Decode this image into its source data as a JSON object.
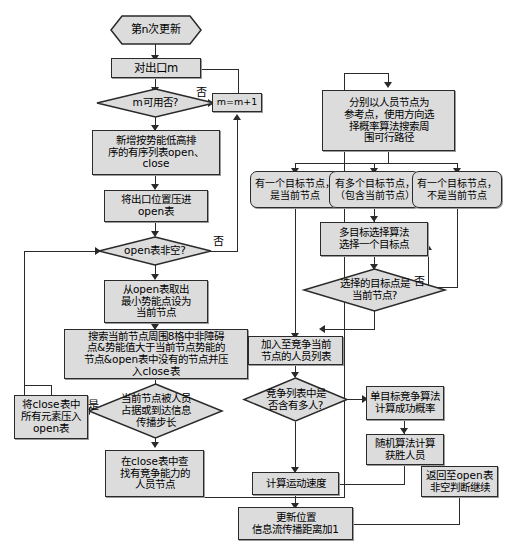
{
  "diagram": {
    "colors": {
      "node_fill": "#dcdcdc",
      "node_stroke": "#2a2a2a",
      "line": "#2a2a2a",
      "background": "#ffffff"
    },
    "nodes": [
      {
        "id": "start",
        "shape": "hexagon",
        "text": "第n次更新"
      },
      {
        "id": "exit_m",
        "shape": "process",
        "text": "对出口m"
      },
      {
        "id": "m_usable",
        "shape": "decision",
        "text": "m可用否?"
      },
      {
        "id": "m_incr",
        "shape": "process",
        "text": "m=m+1"
      },
      {
        "id": "new_lists",
        "shape": "process",
        "text": "新增按势能低高排\n序的有序列表open、\nclose"
      },
      {
        "id": "push_exit",
        "shape": "process",
        "text": "将出口位置压进\nopen表"
      },
      {
        "id": "open_nonempty",
        "shape": "decision",
        "text": "open表非空?"
      },
      {
        "id": "pop_min",
        "shape": "process",
        "text": "从open表取出\n最小势能点设为\n当前节点"
      },
      {
        "id": "search8",
        "shape": "process",
        "text": "搜索当前节点周围8格中非障碍\n点&势能值大于当前节点势能的\n节点&open表中没有的节点并压\n入close表"
      },
      {
        "id": "occupied",
        "shape": "decision",
        "text": "当前节点被人员\n占据或到达信息\n传播步长"
      },
      {
        "id": "push_close",
        "shape": "process",
        "text": "将close表中\n所有元素压入\nopen表"
      },
      {
        "id": "find_compete",
        "shape": "process",
        "text": "在close表中查\n找有竞争能力的\n人员节点"
      },
      {
        "id": "dir_prob",
        "shape": "process",
        "text": "分别以人员节点为\n参考点，使用方向选\n择概率算法搜索周\n围可行路径"
      },
      {
        "id": "one_target_cur",
        "shape": "process-round",
        "text": "有一个目标节点，\n是当前节点"
      },
      {
        "id": "multi_target",
        "shape": "process-round",
        "text": "有多个目标节点，\n（包含当前节点）"
      },
      {
        "id": "one_target_not",
        "shape": "process-round",
        "text": "有一个目标节点，\n不是当前节点"
      },
      {
        "id": "multi_select",
        "shape": "process",
        "text": "多目标选择算法\n选择一个目标点"
      },
      {
        "id": "sel_is_cur",
        "shape": "decision",
        "text": "选择的目标点是\n当前节点?"
      },
      {
        "id": "add_list",
        "shape": "process",
        "text": "加入至竞争当前\n节点的人员列表"
      },
      {
        "id": "many_people",
        "shape": "decision",
        "text": "竞争列表中是\n否含有多人?"
      },
      {
        "id": "single_prob",
        "shape": "process",
        "text": "单目标竞争算法\n计算成功概率"
      },
      {
        "id": "random_win",
        "shape": "process",
        "text": "随机算法计算\n获胜人员"
      },
      {
        "id": "calc_speed",
        "shape": "process",
        "text": "计算运动速度"
      },
      {
        "id": "back_open",
        "shape": "process",
        "text": "返回至open表\n非空判断继续"
      },
      {
        "id": "update_pos",
        "shape": "process",
        "text": "更新位置\n信息流传播距离加1"
      }
    ],
    "edge_labels": {
      "m_usable_no": "否",
      "open_nonempty_no": "否",
      "occupied_yes": "是",
      "sel_is_cur_no": "否"
    }
  }
}
